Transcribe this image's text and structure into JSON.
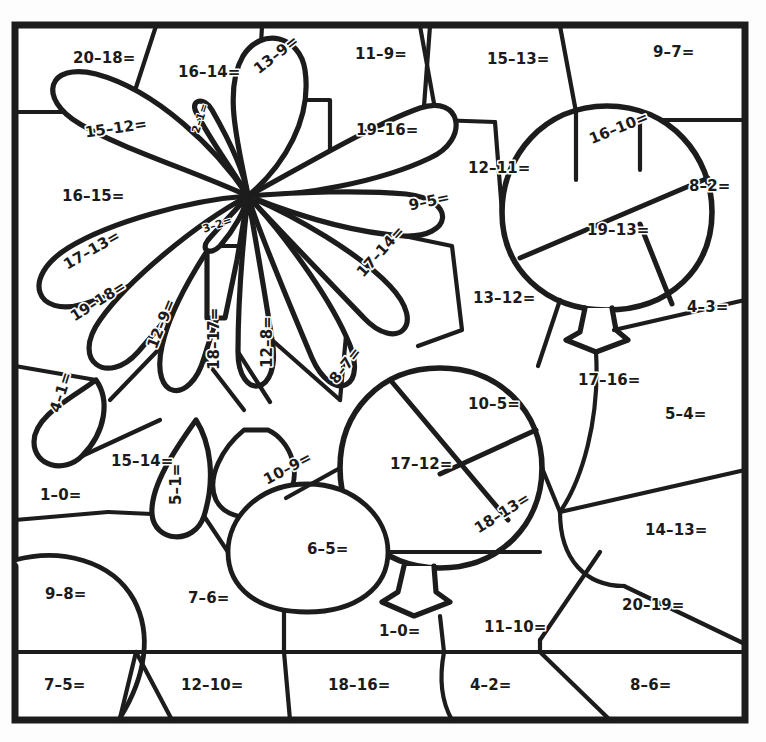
{
  "worksheet": {
    "type": "color-by-number subtraction worksheet",
    "subject": "single-digit subtraction facts",
    "picture": "flower and two balloons",
    "ink_color": "#1c1c1c",
    "background_color": "#ffffff",
    "problem_count": 48
  },
  "problems": [
    {
      "id": "p01",
      "text": "20–18=",
      "x": 73,
      "y": 58,
      "rot": 0,
      "size": "md",
      "region": "top-left-panel"
    },
    {
      "id": "p02",
      "text": "16–14=",
      "x": 178,
      "y": 72,
      "rot": 0,
      "size": "md",
      "region": "top-panel"
    },
    {
      "id": "p03",
      "text": "13–9=",
      "x": 256,
      "y": 71,
      "rot": -38,
      "size": "md",
      "region": "flower-petal-upper"
    },
    {
      "id": "p04",
      "text": "11–9=",
      "x": 355,
      "y": 54,
      "rot": 0,
      "size": "md",
      "region": "top-panel"
    },
    {
      "id": "p05",
      "text": "15–13=",
      "x": 487,
      "y": 59,
      "rot": 0,
      "size": "md",
      "region": "top-panel"
    },
    {
      "id": "p06",
      "text": "9–7=",
      "x": 653,
      "y": 52,
      "rot": 0,
      "size": "md",
      "region": "top-right-panel"
    },
    {
      "id": "p07",
      "text": "15–12=",
      "x": 85,
      "y": 133,
      "rot": -8,
      "size": "md",
      "region": "flower-petal-left"
    },
    {
      "id": "p08",
      "text": "2–1=",
      "x": 196,
      "y": 133,
      "rot": -72,
      "size": "sm",
      "region": "flower-petal-tiny"
    },
    {
      "id": "p09",
      "text": "19–16=",
      "x": 356,
      "y": 130,
      "rot": 0,
      "size": "md",
      "region": "flower-petal-upper-right"
    },
    {
      "id": "p10",
      "text": "16–10=",
      "x": 590,
      "y": 140,
      "rot": -22,
      "size": "md",
      "region": "balloon-top-slice"
    },
    {
      "id": "p11",
      "text": "12–11=",
      "x": 468,
      "y": 168,
      "rot": 0,
      "size": "md",
      "region": "mid-panel"
    },
    {
      "id": "p12",
      "text": "8–2=",
      "x": 689,
      "y": 186,
      "rot": 0,
      "size": "md",
      "region": "balloon-top-slice"
    },
    {
      "id": "p13",
      "text": "16–15=",
      "x": 62,
      "y": 196,
      "rot": 0,
      "size": "md",
      "region": "left-panel"
    },
    {
      "id": "p14",
      "text": "9–5=",
      "x": 409,
      "y": 206,
      "rot": -12,
      "size": "md",
      "region": "flower-petal-right"
    },
    {
      "id": "p15",
      "text": "19–13=",
      "x": 587,
      "y": 230,
      "rot": 0,
      "size": "md",
      "region": "balloon-top-slice"
    },
    {
      "id": "p16",
      "text": "3–2=",
      "x": 203,
      "y": 230,
      "rot": -18,
      "size": "sm",
      "region": "flower-petal-tiny"
    },
    {
      "id": "p17",
      "text": "17–13=",
      "x": 65,
      "y": 266,
      "rot": -30,
      "size": "md",
      "region": "flower-petal-left"
    },
    {
      "id": "p18",
      "text": "17–14=",
      "x": 360,
      "y": 275,
      "rot": -48,
      "size": "md",
      "region": "flower-petal-right"
    },
    {
      "id": "p19",
      "text": "13–12=",
      "x": 473,
      "y": 298,
      "rot": 0,
      "size": "md",
      "region": "mid-panel"
    },
    {
      "id": "p20",
      "text": "4–3=",
      "x": 687,
      "y": 307,
      "rot": 0,
      "size": "md",
      "region": "right-panel"
    },
    {
      "id": "p21",
      "text": "19–18=",
      "x": 72,
      "y": 318,
      "rot": -32,
      "size": "md",
      "region": "flower-petal-left"
    },
    {
      "id": "p22",
      "text": "12–9=",
      "x": 152,
      "y": 348,
      "rot": -68,
      "size": "md",
      "region": "flower-petal"
    },
    {
      "id": "p23",
      "text": "18–17=",
      "x": 214,
      "y": 370,
      "rot": -90,
      "size": "md",
      "region": "flower-petal"
    },
    {
      "id": "p24",
      "text": "12–8=",
      "x": 267,
      "y": 368,
      "rot": -90,
      "size": "md",
      "region": "flower-petal"
    },
    {
      "id": "p25",
      "text": "8–7=",
      "x": 333,
      "y": 382,
      "rot": -52,
      "size": "md",
      "region": "flower-petal"
    },
    {
      "id": "p26",
      "text": "17–16=",
      "x": 578,
      "y": 380,
      "rot": 0,
      "size": "md",
      "region": "balloon-string-panel"
    },
    {
      "id": "p27",
      "text": "10–5=",
      "x": 468,
      "y": 404,
      "rot": 0,
      "size": "md",
      "region": "balloon-bottom-slice"
    },
    {
      "id": "p28",
      "text": "5–4=",
      "x": 665,
      "y": 414,
      "rot": 0,
      "size": "md",
      "region": "right-panel"
    },
    {
      "id": "p29",
      "text": "4–1=",
      "x": 55,
      "y": 412,
      "rot": -72,
      "size": "md",
      "region": "flower-petal-small"
    },
    {
      "id": "p30",
      "text": "15–14=",
      "x": 111,
      "y": 461,
      "rot": 0,
      "size": "md",
      "region": "mid-left-panel"
    },
    {
      "id": "p31",
      "text": "17–12=",
      "x": 390,
      "y": 464,
      "rot": 0,
      "size": "md",
      "region": "balloon-bottom-slice"
    },
    {
      "id": "p32",
      "text": "10–9=",
      "x": 265,
      "y": 481,
      "rot": -28,
      "size": "md",
      "region": "flower-petal"
    },
    {
      "id": "p33",
      "text": "5–1=",
      "x": 176,
      "y": 505,
      "rot": -90,
      "size": "md",
      "region": "flower-petal"
    },
    {
      "id": "p34",
      "text": "1–0=",
      "x": 40,
      "y": 495,
      "rot": 0,
      "size": "md",
      "region": "left-panel"
    },
    {
      "id": "p35",
      "text": "18–13=",
      "x": 476,
      "y": 530,
      "rot": -32,
      "size": "md",
      "region": "balloon-bottom-slice"
    },
    {
      "id": "p36",
      "text": "14–13=",
      "x": 645,
      "y": 530,
      "rot": 0,
      "size": "md",
      "region": "right-panel"
    },
    {
      "id": "p37",
      "text": "6–5=",
      "x": 307,
      "y": 549,
      "rot": 0,
      "size": "md",
      "region": "circle-blob"
    },
    {
      "id": "p38",
      "text": "20–19=",
      "x": 622,
      "y": 605,
      "rot": 0,
      "size": "md",
      "region": "right-panel"
    },
    {
      "id": "p39",
      "text": "9–8=",
      "x": 45,
      "y": 594,
      "rot": 0,
      "size": "md",
      "region": "bottom-panel"
    },
    {
      "id": "p40",
      "text": "7–6=",
      "x": 188,
      "y": 598,
      "rot": 0,
      "size": "md",
      "region": "bottom-panel"
    },
    {
      "id": "p41",
      "text": "1–0=",
      "x": 379,
      "y": 631,
      "rot": 0,
      "size": "md",
      "region": "bottom-panel"
    },
    {
      "id": "p42",
      "text": "11–10=",
      "x": 484,
      "y": 627,
      "rot": 0,
      "size": "md",
      "region": "balloon-knot-panel"
    },
    {
      "id": "p43",
      "text": "7–5=",
      "x": 44,
      "y": 685,
      "rot": 0,
      "size": "md",
      "region": "bottom-row"
    },
    {
      "id": "p44",
      "text": "12–10=",
      "x": 181,
      "y": 685,
      "rot": 0,
      "size": "md",
      "region": "bottom-row"
    },
    {
      "id": "p45",
      "text": "18–16=",
      "x": 328,
      "y": 685,
      "rot": 0,
      "size": "md",
      "region": "bottom-row"
    },
    {
      "id": "p46",
      "text": "4–2=",
      "x": 470,
      "y": 685,
      "rot": 0,
      "size": "md",
      "region": "bottom-row"
    },
    {
      "id": "p47",
      "text": "8–6=",
      "x": 630,
      "y": 685,
      "rot": 0,
      "size": "md",
      "region": "bottom-row"
    }
  ]
}
